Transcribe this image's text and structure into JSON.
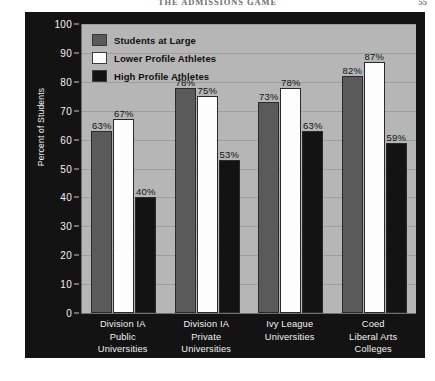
{
  "header": {
    "running_title": "THE ADMISSIONS GAME",
    "page_number": "55"
  },
  "figure": {
    "y_axis_title": "Percent of Students"
  },
  "legend": {
    "items": [
      {
        "label": "Students at Large",
        "color": "#5a5a5a"
      },
      {
        "label": "Lower Profile Athletes",
        "color": "#fdfdfd"
      },
      {
        "label": "High Profile Athletes",
        "color": "#131313"
      }
    ]
  },
  "chart_data": {
    "type": "bar",
    "title": "",
    "xlabel": "",
    "ylabel": "Percent of Students",
    "ylim": [
      0,
      100
    ],
    "yticks": [
      0,
      10,
      20,
      30,
      40,
      50,
      60,
      70,
      80,
      90,
      100
    ],
    "ytick_labels": [
      "0",
      "10",
      "20",
      "30",
      "40",
      "50",
      "60",
      "70",
      "80",
      "90",
      "100"
    ],
    "grid": true,
    "legend_position": "upper-left-inside",
    "categories": [
      "Division IA Public Universities",
      "Division IA Private Universities",
      "Ivy League Universities",
      "Coed Liberal Arts Colleges"
    ],
    "category_lines": [
      [
        "Division IA",
        "Public",
        "Universities"
      ],
      [
        "Division IA",
        "Private",
        "Universities"
      ],
      [
        "Ivy League",
        "Universities"
      ],
      [
        "Coed",
        "Liberal Arts",
        "Colleges"
      ]
    ],
    "series": [
      {
        "name": "Students at Large",
        "color": "#5a5a5a",
        "values": [
          63,
          78,
          73,
          82
        ],
        "labels": [
          "63%",
          "78%",
          "73%",
          "82%"
        ]
      },
      {
        "name": "Lower Profile Athletes",
        "color": "#fdfdfd",
        "values": [
          67,
          75,
          78,
          87
        ],
        "labels": [
          "67%",
          "75%",
          "78%",
          "87%"
        ]
      },
      {
        "name": "High Profile Athletes",
        "color": "#131313",
        "values": [
          40,
          53,
          63,
          59
        ],
        "labels": [
          "40%",
          "53%",
          "63%",
          "59%"
        ]
      }
    ]
  }
}
